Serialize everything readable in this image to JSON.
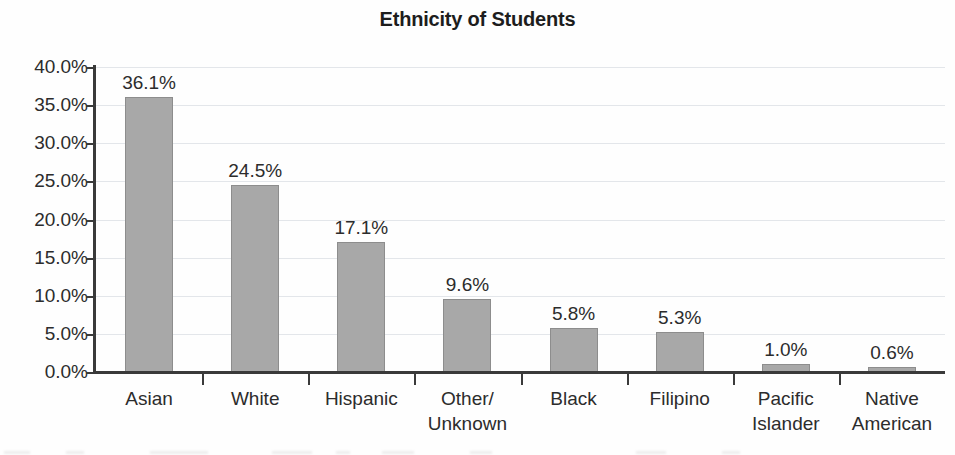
{
  "chart_data": {
    "type": "bar",
    "title": "Ethnicity of Students",
    "xlabel": "",
    "ylabel": "",
    "ylim": [
      0,
      40
    ],
    "grid": true,
    "legend": "none",
    "y_tick_labels": [
      "40.0%",
      "35.0%",
      "30.0%",
      "25.0%",
      "20.0%",
      "15.0%",
      "10.0%",
      "5.0%",
      "0.0%"
    ],
    "y_tick_values": [
      40,
      35,
      30,
      25,
      20,
      15,
      10,
      5,
      0
    ],
    "categories": [
      "Asian",
      "White",
      "Hispanic",
      "Other/ Unknown",
      "Black",
      "Filipino",
      "Pacific Islander",
      "Native American"
    ],
    "category_lines": [
      [
        "Asian"
      ],
      [
        "White"
      ],
      [
        "Hispanic"
      ],
      [
        "Other/",
        "Unknown"
      ],
      [
        "Black"
      ],
      [
        "Filipino"
      ],
      [
        "Pacific",
        "Islander"
      ],
      [
        "Native",
        "American"
      ]
    ],
    "values": [
      36.1,
      24.5,
      17.1,
      9.6,
      5.8,
      5.3,
      1.0,
      0.6
    ],
    "data_labels": [
      "36.1%",
      "24.5%",
      "17.1%",
      "9.6%",
      "5.8%",
      "5.3%",
      "1.0%",
      "0.6%"
    ],
    "colors": {
      "bar_fill": "#a8a8a8",
      "bar_border": "#8d8d8d",
      "axis": "#3a3a3a",
      "gridline": "#e3e6ea",
      "text": "#2c2c2c",
      "title": "#1d1d1d",
      "background": "#fefefe"
    }
  }
}
